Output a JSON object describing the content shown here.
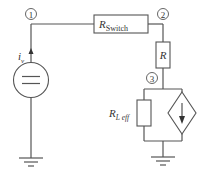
{
  "diagram": {
    "type": "circuit-schematic",
    "nodes": [
      {
        "id": "node-1",
        "label": "1"
      },
      {
        "id": "node-2",
        "label": "2"
      },
      {
        "id": "node-3",
        "label": "3"
      }
    ],
    "components": {
      "current_source": {
        "label": "i",
        "subscript": "v"
      },
      "r_switch": {
        "label": "R",
        "subscript": "Switch"
      },
      "r": {
        "label": "R"
      },
      "r_leff": {
        "label": "R",
        "subscript": "L eff"
      },
      "dependent_source": {
        "label": ""
      }
    },
    "colors": {
      "wire": "#555555",
      "text": "#333333",
      "background": "#ffffff"
    }
  }
}
